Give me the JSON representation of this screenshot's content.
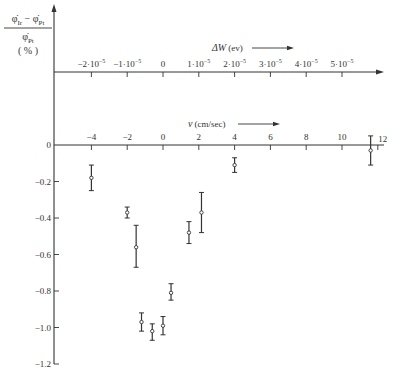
{
  "chart_data": {
    "type": "scatter",
    "title": "",
    "ylabel": {
      "numerator": "φ̇Ir − φ̇Pt",
      "numerator_parts": [
        "φ̇",
        "Ir",
        " − ",
        "φ̇",
        "Pt"
      ],
      "denominator_parts": [
        "φ̇",
        "Pt"
      ],
      "unit": "( % )"
    },
    "xlabel": "v (cm/sec)",
    "xlabel_parts": {
      "symbol": "v",
      "unit": "(cm/sec)"
    },
    "secondary_xlabel": "ΔW (ev)",
    "secondary_xlabel_parts": {
      "symbol": "ΔW",
      "unit": "(ev)"
    },
    "xlim": [
      -6,
      12.3
    ],
    "ylim": [
      -1.2,
      0.1
    ],
    "grid": false,
    "legend": null,
    "x_ticks": [
      -4,
      -2,
      0,
      2,
      4,
      6,
      8,
      10,
      12
    ],
    "x_tick_labels": [
      "−4",
      "−2",
      "0",
      "2",
      "4",
      "6",
      "8",
      "10",
      "12"
    ],
    "y_ticks": [
      0,
      -0.2,
      -0.4,
      -0.6,
      -0.8,
      -1.0,
      -1.2
    ],
    "y_tick_labels": [
      "0",
      "−0.2",
      "−0.4",
      "−0.6",
      "−0.8",
      "−1.0",
      "−1.2"
    ],
    "secondary_x_ticks_v": [
      -4,
      -2,
      0,
      2,
      4,
      6,
      8,
      10
    ],
    "secondary_x_tick_labels": [
      {
        "mant": "−2·10",
        "exp": "−5"
      },
      {
        "mant": "−1·10",
        "exp": "−5"
      },
      {
        "mant": "0",
        "exp": ""
      },
      {
        "mant": "1·10",
        "exp": "−5"
      },
      {
        "mant": "2·10",
        "exp": "−5"
      },
      {
        "mant": "3·10",
        "exp": "−5"
      },
      {
        "mant": "4·10",
        "exp": "−5"
      },
      {
        "mant": "5·10",
        "exp": "−5"
      }
    ],
    "secondary_x_values": [
      -2e-05,
      -1e-05,
      0,
      1e-05,
      2e-05,
      3e-05,
      4e-05,
      5e-05
    ],
    "series": [
      {
        "name": "measurements",
        "points": [
          {
            "x": -4.0,
            "y": -0.18,
            "yerr_low": -0.25,
            "yerr_high": -0.11
          },
          {
            "x": -2.0,
            "y": -0.37,
            "yerr_low": -0.4,
            "yerr_high": -0.34
          },
          {
            "x": -1.5,
            "y": -0.56,
            "yerr_low": -0.67,
            "yerr_high": -0.44
          },
          {
            "x": -1.2,
            "y": -0.97,
            "yerr_low": -1.02,
            "yerr_high": -0.92
          },
          {
            "x": -0.6,
            "y": -1.02,
            "yerr_low": -1.07,
            "yerr_high": -0.98
          },
          {
            "x": 0.0,
            "y": -0.99,
            "yerr_low": -1.04,
            "yerr_high": -0.94
          },
          {
            "x": 0.45,
            "y": -0.81,
            "yerr_low": -0.85,
            "yerr_high": -0.76
          },
          {
            "x": 1.45,
            "y": -0.48,
            "yerr_low": -0.54,
            "yerr_high": -0.42
          },
          {
            "x": 2.15,
            "y": -0.37,
            "yerr_low": -0.48,
            "yerr_high": -0.26
          },
          {
            "x": 4.0,
            "y": -0.11,
            "yerr_low": -0.15,
            "yerr_high": -0.07
          },
          {
            "x": 11.6,
            "y": -0.03,
            "yerr_low": -0.11,
            "yerr_high": 0.05
          }
        ]
      }
    ]
  },
  "colors": {
    "ink": "#333333",
    "background": "#ffffff"
  }
}
